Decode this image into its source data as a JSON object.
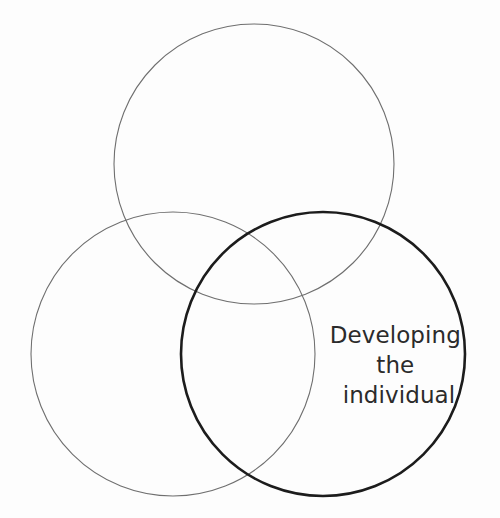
{
  "diagram": {
    "type": "venn",
    "title": "",
    "background_color": "#fdfdfd",
    "canvas": {
      "width": 500,
      "height": 518
    },
    "circles": [
      {
        "id": "top",
        "name": "top-circle",
        "label": "",
        "cx": 254,
        "cy": 164,
        "r": 140,
        "stroke_color": "#6f6f6f",
        "stroke_width": 1.1,
        "emphasis": "normal"
      },
      {
        "id": "bottom-left",
        "name": "bottom-left-circle",
        "label": "",
        "cx": 173,
        "cy": 354,
        "r": 142,
        "stroke_color": "#6f6f6f",
        "stroke_width": 1.1,
        "emphasis": "normal"
      },
      {
        "id": "bottom-right",
        "name": "bottom-right-circle",
        "label": "Developing the individual",
        "cx": 323,
        "cy": 354,
        "r": 142,
        "stroke_color": "#1c1c1c",
        "stroke_width": 2.6,
        "emphasis": "highlighted"
      }
    ],
    "labels": [
      {
        "id": "developing-the-individual",
        "name": "developing-the-individual-label",
        "belongs_to": "bottom-right",
        "x": 399,
        "y": 343,
        "line_height": 30,
        "font_size": 23,
        "color": "#2b2b2b",
        "align": "middle",
        "lines": [
          "Developing",
          "the",
          "individual"
        ]
      }
    ]
  },
  "label_lines": {
    "line1": "Developing",
    "line2": "the",
    "line3": "individual"
  }
}
